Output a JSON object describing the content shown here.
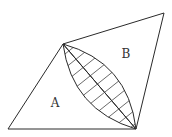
{
  "diagram": {
    "stroke_color": "#2a2a2a",
    "background": "#ffffff",
    "vertices": {
      "top": [
        63,
        44
      ],
      "top_right": [
        164,
        13
      ],
      "bottom_right": [
        136,
        129
      ],
      "bottom_left": [
        8,
        129
      ]
    },
    "regions": [
      {
        "id": "A",
        "label": "A",
        "position": [
          55,
          107
        ]
      },
      {
        "id": "B",
        "label": "B",
        "position": [
          126,
          58
        ]
      }
    ],
    "shaded_region": {
      "shape": "lens",
      "fill": "hatched",
      "hatch_count": 11
    }
  }
}
